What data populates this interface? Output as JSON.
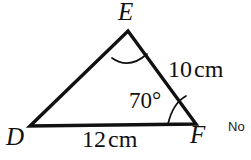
{
  "figure": {
    "kind": "triangle-geometry-diagram",
    "background_color": "#ffffff",
    "stroke_color": "#111111",
    "stroke_width": 3,
    "arc_stroke_width": 1.6,
    "vertices": {
      "E": {
        "label": "E",
        "x": 128,
        "y": 31
      },
      "D": {
        "label": "D",
        "x": 30,
        "y": 126
      },
      "F": {
        "label": "F",
        "x": 196,
        "y": 124
      }
    },
    "sides": [
      {
        "name": "DE",
        "from": "D",
        "to": "E",
        "label": ""
      },
      {
        "name": "EF",
        "from": "E",
        "to": "F",
        "label": "10",
        "unit": "cm"
      },
      {
        "name": "DF",
        "from": "D",
        "to": "F",
        "label": "12",
        "unit": "cm"
      }
    ],
    "angles": [
      {
        "at": "E",
        "label": "",
        "marked": true,
        "arc_radius": 30
      },
      {
        "at": "F",
        "label": "70°",
        "marked": true,
        "arc_radius": 28
      }
    ]
  },
  "labels": {
    "vertex_E": "E",
    "vertex_D": "D",
    "vertex_F": "F",
    "side_EF_value": "10",
    "side_EF_unit": "cm",
    "side_DF_value": "12",
    "side_DF_unit": "cm",
    "angle_F": "70°"
  },
  "margin_note": {
    "text": "No",
    "clipped": true
  }
}
